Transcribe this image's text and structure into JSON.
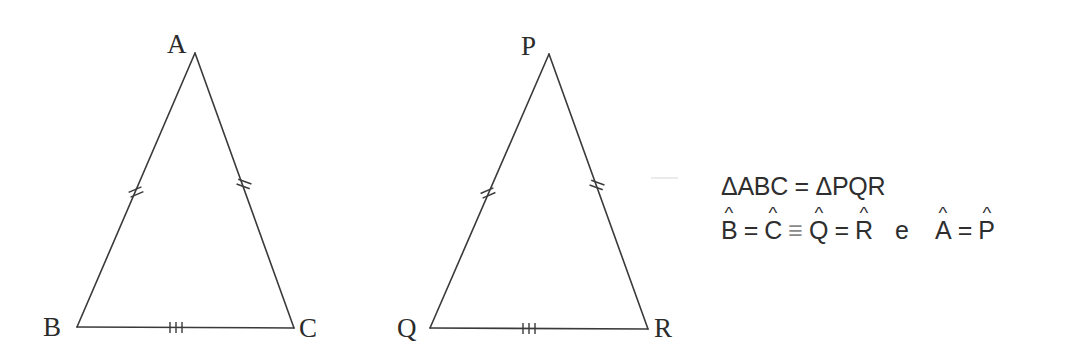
{
  "figure": {
    "triangles": [
      {
        "name": "ABC",
        "vertices": {
          "A": {
            "label": "A",
            "x": 195,
            "y": 53
          },
          "B": {
            "label": "B",
            "x": 77,
            "y": 327
          },
          "C": {
            "label": "C",
            "x": 294,
            "y": 328
          }
        },
        "marks": {
          "AB": "double-tick",
          "AC": "double-tick",
          "BC": "triple-tick"
        }
      },
      {
        "name": "PQR",
        "vertices": {
          "P": {
            "label": "P",
            "x": 549,
            "y": 54
          },
          "Q": {
            "label": "Q",
            "x": 430,
            "y": 328
          },
          "R": {
            "label": "R",
            "x": 648,
            "y": 329
          }
        },
        "marks": {
          "PQ": "double-tick",
          "PR": "double-tick",
          "QR": "triple-tick"
        }
      }
    ],
    "labels": {
      "A": "A",
      "B": "B",
      "C": "C",
      "P": "P",
      "Q": "Q",
      "R": "R"
    },
    "line_color": "#3a3a3a"
  },
  "equations": {
    "line1": "ΔABC = ΔPQR",
    "line2": {
      "B": "B",
      "eq1": "=",
      "C": "C",
      "equiv": "≡",
      "Q": "Q",
      "eq2": "=",
      "R": "R",
      "conj": "e",
      "A": "A",
      "eq3": "=",
      "P": "P"
    }
  }
}
